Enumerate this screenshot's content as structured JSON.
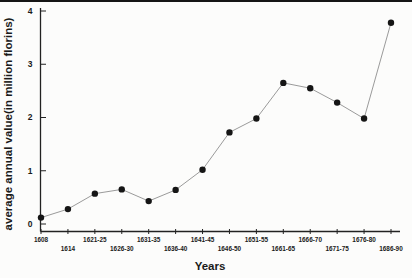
{
  "chart_data": {
    "type": "line",
    "title": "",
    "xlabel": "Years",
    "ylabel": "average annual value(in million florins)",
    "categories": [
      "1608",
      "1614",
      "1621-25",
      "1626-30",
      "1631-35",
      "1636-40",
      "1641-45",
      "1646-50",
      "1651-55",
      "1661-65",
      "1666-70",
      "1671-75",
      "1676-80",
      "1686-90"
    ],
    "values": [
      0.12,
      0.28,
      0.57,
      0.65,
      0.43,
      0.64,
      1.02,
      1.72,
      1.98,
      2.65,
      2.55,
      2.28,
      1.98,
      3.78
    ],
    "ylim": [
      0,
      4
    ],
    "yticks": [
      0,
      1,
      2,
      3,
      4
    ],
    "grid": false,
    "legend": false,
    "marker": "filled-circle",
    "x_label_rows": "alternating",
    "colors": {
      "point": "#151515",
      "line": "#8f8f8f",
      "axis": "#222222",
      "text": "#1a1a1a",
      "background": "#fcfcfb",
      "top_rule": "#151515"
    }
  }
}
